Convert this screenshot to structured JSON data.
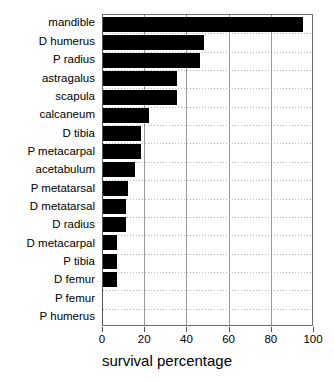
{
  "chart_data": {
    "type": "bar",
    "orientation": "horizontal",
    "title": "",
    "xlabel": "survival percentage",
    "ylabel": "",
    "xlim": [
      0,
      100
    ],
    "xticks": [
      0,
      20,
      40,
      60,
      80,
      100
    ],
    "xtick_labels": [
      "0",
      "20",
      "40",
      "60",
      "80",
      "100"
    ],
    "grid": "both",
    "legend": "none",
    "bar_color": "#000000",
    "categories": [
      "mandible",
      "D humerus",
      "P radius",
      "astragalus",
      "scapula",
      "calcaneum",
      "D tibia",
      "P metacarpal",
      "acetabulum",
      "P metatarsal",
      "D metatarsal",
      "D radius",
      "D metacarpal",
      "P tibia",
      "D femur",
      "P femur",
      "P humerus"
    ],
    "values": [
      95,
      48,
      46,
      35,
      35,
      22,
      18,
      18,
      15,
      12,
      11,
      11,
      6.5,
      6.5,
      6.5,
      0,
      0
    ]
  }
}
